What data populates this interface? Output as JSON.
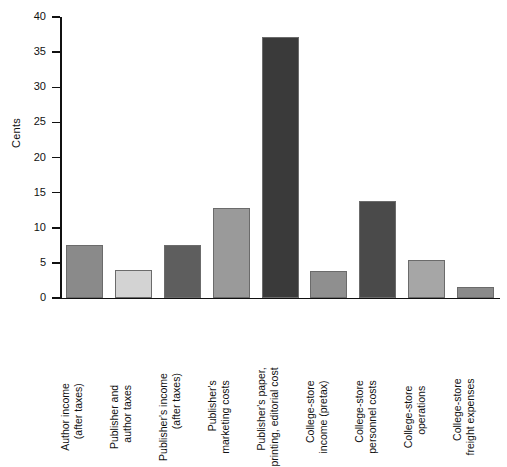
{
  "chart_data": {
    "type": "bar",
    "title": "",
    "xlabel": "",
    "ylabel": "Cents",
    "ylim": [
      0,
      40
    ],
    "yticks": [
      0,
      5,
      10,
      15,
      20,
      25,
      30,
      35,
      40
    ],
    "grid": false,
    "legend": "none",
    "categories": [
      "Author income (after taxes)",
      "Publisher and author taxes",
      "Publisher's income (after taxes)",
      "Publisher's marketing costs",
      "Publisher's paper, printing, editorial cost",
      "College-store income (pretax)",
      "College-store personnel costs",
      "College-store operations",
      "College-store freight expenses"
    ],
    "category_lines": [
      [
        "Author income",
        "(after taxes)"
      ],
      [
        "Publisher and",
        "author taxes"
      ],
      [
        "Publisher's income",
        "(after taxes)"
      ],
      [
        "Publisher's",
        "marketing costs"
      ],
      [
        "Publisher's paper,",
        "printing, editorial cost"
      ],
      [
        "College-store",
        "income (pretax)"
      ],
      [
        "College-store",
        "personnel costs"
      ],
      [
        "College-store",
        "operations"
      ],
      [
        "College-store",
        "freight expenses"
      ]
    ],
    "values": [
      7.5,
      4.0,
      7.6,
      12.8,
      37.2,
      3.9,
      13.8,
      5.4,
      1.6
    ],
    "bar_colors": [
      "#8a8a8a",
      "#d3d3d3",
      "#5e5e5e",
      "#9a9a9a",
      "#3a3a3a",
      "#8f8f8f",
      "#4a4a4a",
      "#a6a6a6",
      "#8a8a8a"
    ]
  }
}
